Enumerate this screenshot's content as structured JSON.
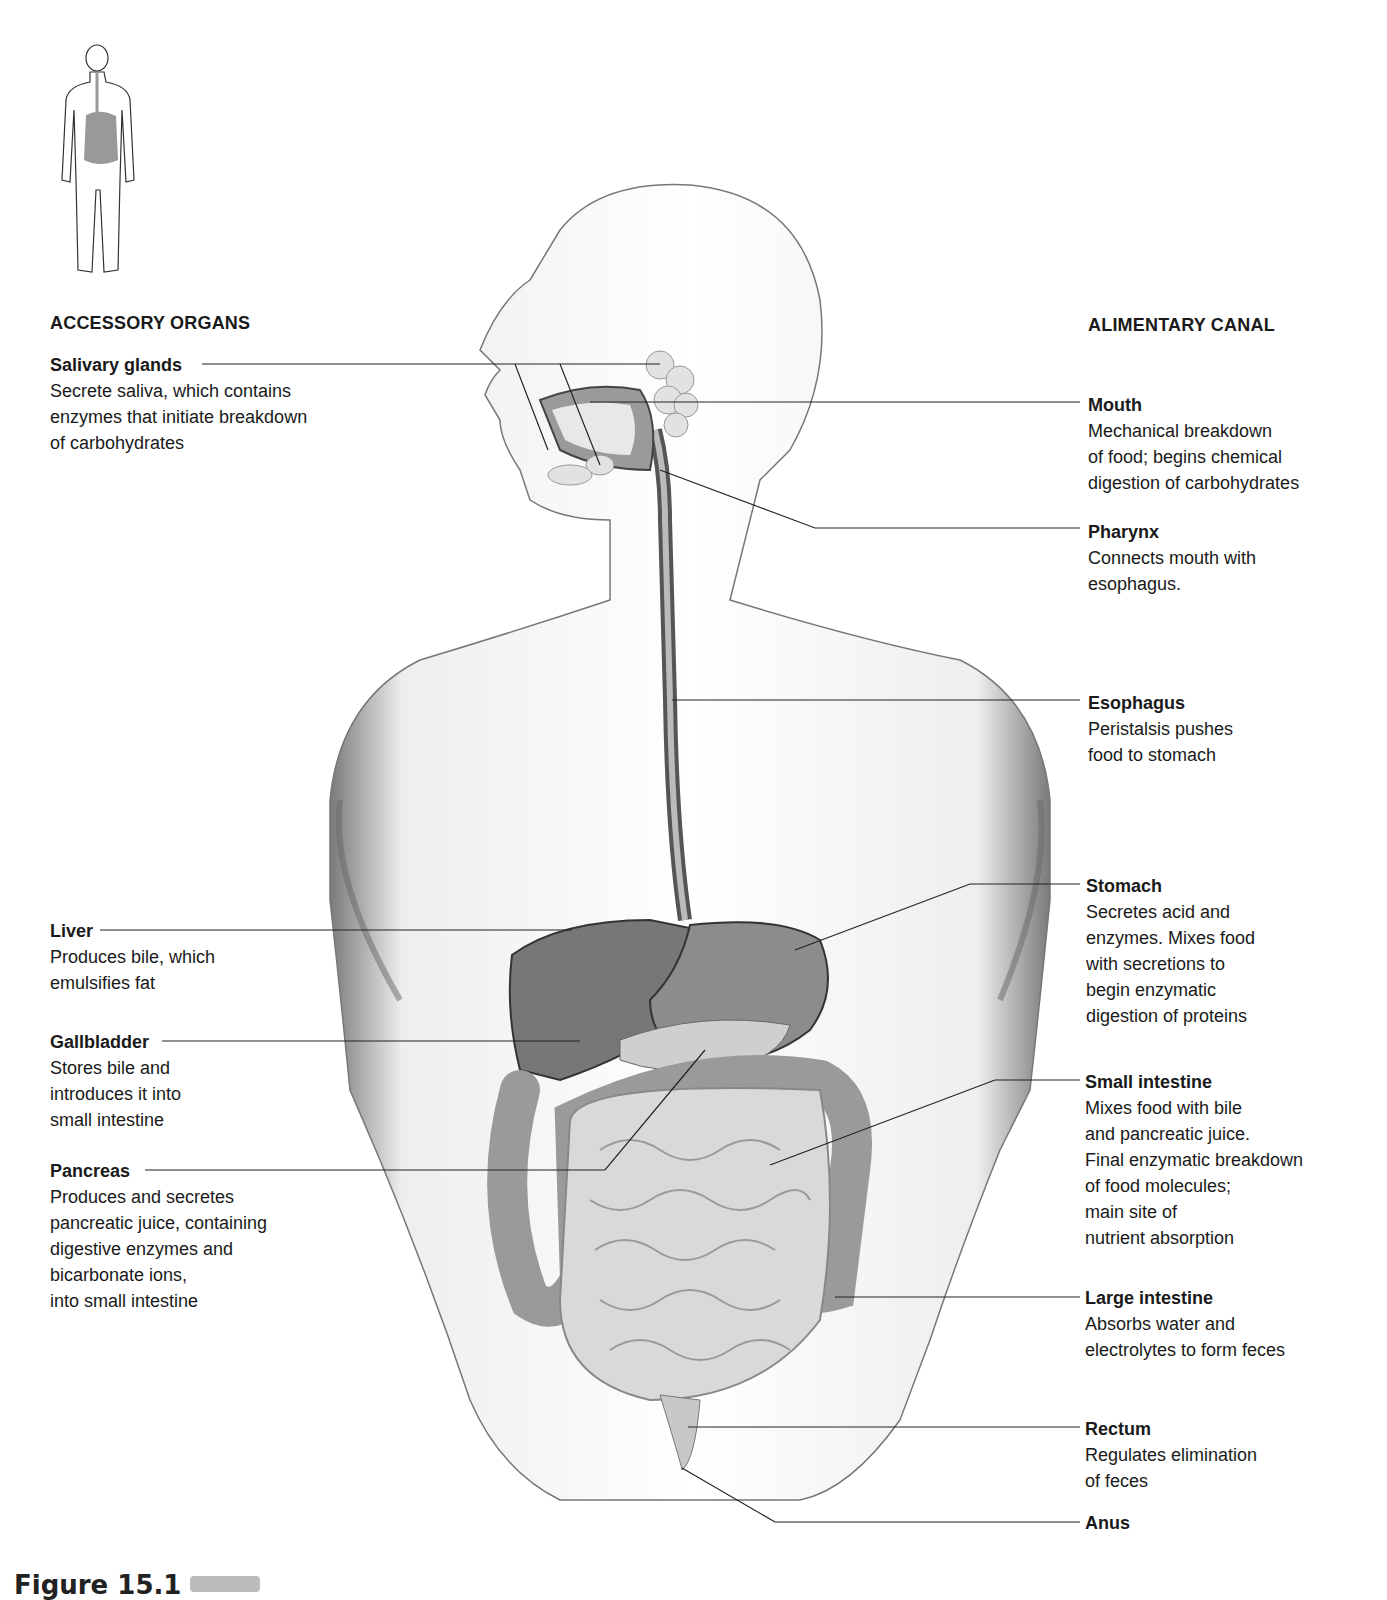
{
  "figure": {
    "caption_partial": "Figure 15.1",
    "badge": "",
    "left_heading": "ACCESSORY ORGANS",
    "right_heading": "ALIMENTARY CANAL"
  },
  "accessory_organs": [
    {
      "name": "Salivary glands",
      "description": "Secrete saliva, which contains\nenzymes that initiate breakdown\nof carbohydrates"
    },
    {
      "name": "Liver",
      "description": "Produces bile, which\nemulsifies fat"
    },
    {
      "name": "Gallbladder",
      "description": "Stores bile and\nintroduces it into\nsmall intestine"
    },
    {
      "name": "Pancreas",
      "description": "Produces and secretes\npancreatic juice, containing\ndigestive enzymes and\nbicarbonate ions,\ninto small intestine"
    }
  ],
  "alimentary_canal": [
    {
      "name": "Mouth",
      "description": "Mechanical breakdown\nof food; begins chemical\ndigestion of carbohydrates"
    },
    {
      "name": "Pharynx",
      "description": "Connects mouth with\nesophagus."
    },
    {
      "name": "Esophagus",
      "description": "Peristalsis pushes\nfood to stomach"
    },
    {
      "name": "Stomach",
      "description": "Secretes acid and\nenzymes. Mixes food\nwith secretions to\nbegin enzymatic\ndigestion of proteins"
    },
    {
      "name": "Small intestine",
      "description": "Mixes food with bile\nand pancreatic juice.\nFinal enzymatic breakdown\nof food molecules;\nmain site of\nnutrient absorption"
    },
    {
      "name": "Large intestine",
      "description": "Absorbs water and\nelectrolytes to form feces"
    },
    {
      "name": "Rectum",
      "description": "Regulates elimination\nof feces"
    },
    {
      "name": "Anus",
      "description": ""
    }
  ]
}
